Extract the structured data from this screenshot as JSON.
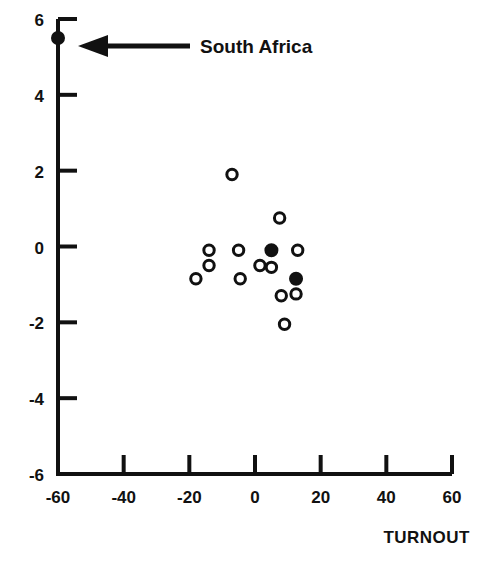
{
  "chart_data": {
    "type": "scatter",
    "title": "",
    "xlabel": "TURNOUT",
    "ylabel": "",
    "xlim": [
      -60,
      60
    ],
    "ylim": [
      -6,
      6
    ],
    "xticks": [
      -60,
      -40,
      -20,
      0,
      20,
      40,
      60
    ],
    "yticks": [
      6,
      4,
      2,
      0,
      -2,
      -4,
      -6
    ],
    "xtick_labels": [
      "-60",
      "-40",
      "-20",
      "0",
      "20",
      "40",
      "60"
    ],
    "ytick_labels": [
      "6",
      "4",
      "2",
      "0",
      "-2",
      "-4",
      "-6"
    ],
    "grid": false,
    "legend": null,
    "marker": "open-circle",
    "series": [
      {
        "name": "observations",
        "points": [
          {
            "x": -60.0,
            "y": 5.5,
            "filled": true,
            "label": "South Africa"
          },
          {
            "x": -7.0,
            "y": 1.9,
            "filled": false
          },
          {
            "x": 7.5,
            "y": 0.75,
            "filled": false
          },
          {
            "x": -14.0,
            "y": -0.1,
            "filled": false
          },
          {
            "x": -14.0,
            "y": -0.5,
            "filled": false
          },
          {
            "x": -18.0,
            "y": -0.85,
            "filled": false
          },
          {
            "x": -5.0,
            "y": -0.1,
            "filled": false
          },
          {
            "x": -4.5,
            "y": -0.85,
            "filled": false
          },
          {
            "x": 1.5,
            "y": -0.5,
            "filled": false
          },
          {
            "x": 5.0,
            "y": -0.1,
            "filled": true
          },
          {
            "x": 5.0,
            "y": -0.55,
            "filled": false
          },
          {
            "x": 13.0,
            "y": -0.1,
            "filled": false
          },
          {
            "x": 12.5,
            "y": -0.85,
            "filled": true
          },
          {
            "x": 12.5,
            "y": -1.25,
            "filled": false
          },
          {
            "x": 8.0,
            "y": -1.3,
            "filled": false
          },
          {
            "x": 9.0,
            "y": -2.05,
            "filled": false
          }
        ]
      }
    ],
    "annotations": [
      {
        "text": "South Africa",
        "arrow": "left-arrow",
        "points_to": {
          "x": -60.0,
          "y": 5.5
        },
        "text_x": 53.0,
        "text_y": 5.5
      }
    ]
  },
  "axis": {
    "x_title": "TURNOUT"
  },
  "annotation": {
    "south_africa_label": "South Africa"
  },
  "colors": {
    "ink": "#111111",
    "background": "#ffffff",
    "marker_stroke": "#111111",
    "marker_fill": "#111111"
  }
}
